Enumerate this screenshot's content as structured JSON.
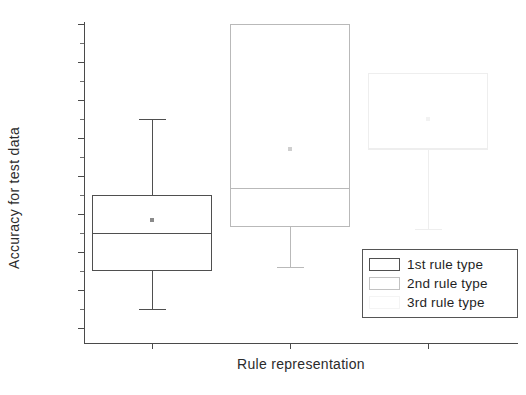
{
  "chart_data": {
    "type": "box",
    "title": "",
    "xlabel": "Rule representation",
    "ylabel": "Accuracy for test data",
    "ylim": [
      83.2,
      100
    ],
    "yticks": [
      84,
      86,
      88,
      90,
      92,
      94,
      96,
      98,
      100
    ],
    "ytick_labels": [
      "84",
      "86",
      "88",
      "90",
      "92",
      "94",
      "96",
      "98",
      "100"
    ],
    "minor_ticks_between": 1,
    "grid": false,
    "categories": [
      "1st rule type",
      "2nd rule type",
      "3rd rule type"
    ],
    "legend_position": "bottom-right",
    "series": [
      {
        "name": "1st rule type",
        "whisker_low": 85.0,
        "q1": 87.0,
        "median": 89.0,
        "q3": 91.0,
        "whisker_high": 95.0,
        "mean": 89.7,
        "has_upper_whisker": true,
        "has_lower_whisker": true
      },
      {
        "name": "2nd rule type",
        "whisker_low": 87.2,
        "q1": 89.3,
        "median": 91.35,
        "q3": 100.0,
        "whisker_high": 100.0,
        "mean": 93.4,
        "has_upper_whisker": false,
        "has_lower_whisker": true
      },
      {
        "name": "3rd rule type",
        "whisker_low": 89.2,
        "q1": 93.4,
        "median": 93.4,
        "q3": 97.4,
        "whisker_high": 97.4,
        "mean": 95.0,
        "has_upper_whisker": false,
        "has_lower_whisker": true
      }
    ]
  },
  "legend": {
    "items": [
      {
        "label": "1st rule type"
      },
      {
        "label": "2nd rule type"
      },
      {
        "label": "3rd rule type"
      }
    ]
  }
}
